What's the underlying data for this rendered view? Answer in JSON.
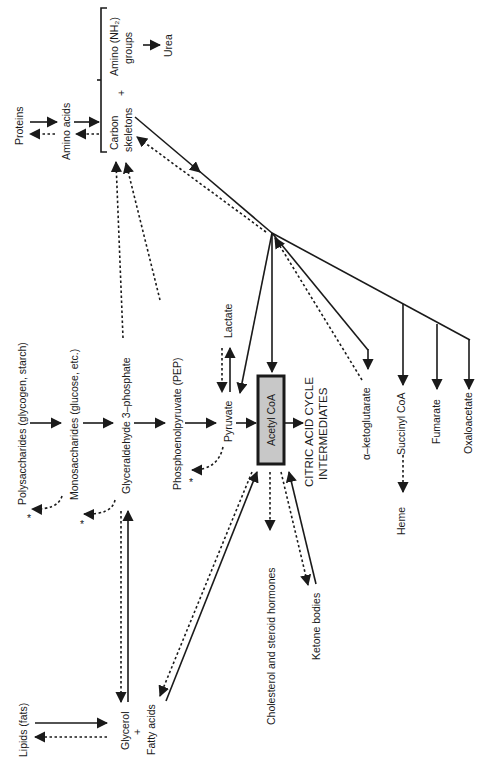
{
  "diagram": {
    "orientation": "rotated-90-ccw",
    "central_node": "Acetyl CoA",
    "central_box_color": "#c8c8c8",
    "nodes": {
      "proteins": "Proteins",
      "amino_acids": "Amino acids",
      "carbon": "Carbon",
      "skeletons": "skeletons",
      "plus_amino": "+",
      "amino_nh2_line1": "Amino (NH₂)",
      "amino_nh2_line2": "groups",
      "urea": "Urea",
      "polysaccharides": "Polysaccharides (glycogen, starch)",
      "monosaccharides": "Monosaccharides (glucose, etc.)",
      "glyceraldehyde": "Glyceraldehyde 3–phosphate",
      "pep": "Phosphoenolpyruvate (PEP)",
      "pyruvate": "Pyruvate",
      "lactate": "Lactate",
      "acetyl_coa": "Acetyl CoA",
      "citric_line1": "CITRIC ACID CYCLE",
      "citric_line2": "INTERMEDIATES",
      "alpha_kg": "α–ketoglutarate",
      "succinyl_coa": "Succinyl CoA",
      "fumarate": "Fumarate",
      "oxaloacetate": "Oxaloacetate",
      "heme": "Heme",
      "cholesterol": "Cholesterol and steroid hormones",
      "ketone": "Ketone bodies",
      "lipids": "Lipids (fats)",
      "glycerol": "Glycerol",
      "plus_lipid": "+",
      "fatty_acids": "Fatty acids",
      "asterisk": "*"
    },
    "legend": {
      "solid_arrow": "degradation (catabolic)",
      "dashed_arrow": "synthesis (anabolic)"
    }
  }
}
